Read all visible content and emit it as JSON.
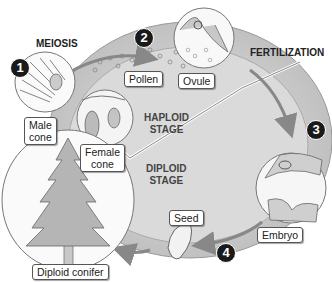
{
  "diagram": {
    "steps": [
      {
        "number": "1",
        "title": "MEIOSIS"
      },
      {
        "number": "2",
        "title": ""
      },
      {
        "number": "3",
        "title": "FERTILIZATION"
      },
      {
        "number": "4",
        "title": ""
      }
    ],
    "stages": {
      "haploid": "HAPLOID\nSTAGE",
      "diploid": "DIPLOID\nSTAGE"
    },
    "labels": {
      "male_cone": "Male\ncone",
      "female_cone": "Female\ncone",
      "pollen": "Pollen",
      "ovule": "Ovule",
      "embryo": "Embryo",
      "seed": "Seed",
      "diploid_conifer": "Diploid conifer"
    },
    "meiosis_title": "MEIOSIS",
    "fertilization_title": "FERTILIZATION",
    "haploid_line1": "HAPLOID",
    "haploid_line2": "STAGE",
    "diploid_line1": "DIPLOID",
    "diploid_line2": "STAGE",
    "colors": {
      "ring": "#c8c8c8",
      "inner": "#d9d9d9",
      "badge": "#1a1a1a"
    }
  }
}
